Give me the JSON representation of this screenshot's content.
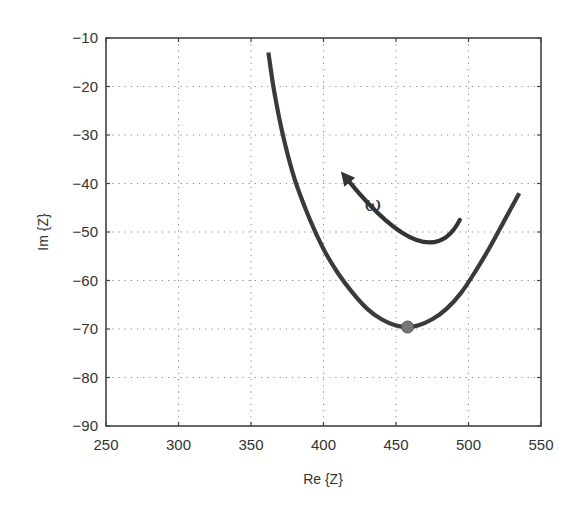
{
  "chart_data": {
    "type": "line",
    "title": "",
    "xlabel": "Re {Z}",
    "ylabel": "Im {Z}",
    "xlim": [
      250,
      550
    ],
    "ylim": [
      -90,
      -10
    ],
    "xticks": [
      250,
      300,
      350,
      400,
      450,
      500,
      550
    ],
    "yticks": [
      -10,
      -20,
      -30,
      -40,
      -50,
      -60,
      -70,
      -80,
      -90
    ],
    "xtick_labels": [
      "250",
      "300",
      "350",
      "400",
      "450",
      "500",
      "550"
    ],
    "ytick_labels": [
      "−10",
      "−20",
      "−30",
      "−40",
      "−50",
      "−60",
      "−70",
      "−80",
      "−90"
    ],
    "grid": true,
    "grid_style": "dotted",
    "legend": null,
    "series": [
      {
        "name": "impedance locus",
        "color": "#3a3a3a",
        "x": [
          362,
          366,
          372,
          380,
          390,
          400,
          410,
          420,
          430,
          440,
          450,
          458,
          465,
          475,
          485,
          495,
          505,
          515,
          525,
          535
        ],
        "y": [
          -13,
          -21,
          -30,
          -39,
          -47,
          -53.5,
          -58.5,
          -62.5,
          -65.8,
          -68,
          -69.3,
          -69.6,
          -69.3,
          -68,
          -65.8,
          -62.5,
          -58,
          -53,
          -47.5,
          -42
        ]
      }
    ],
    "markers": [
      {
        "name": "minimum-point",
        "x": 458,
        "y": -69.6,
        "color": "#777777"
      }
    ],
    "annotations": [
      {
        "type": "curved-arrow",
        "label": "ω",
        "from": {
          "x": 494,
          "y": -47.5
        },
        "via": {
          "x": 463,
          "y": -51.2
        },
        "to": {
          "x": 412,
          "y": -37.5
        },
        "label_pos": {
          "x": 434,
          "y": -43
        },
        "meaning": "direction of increasing frequency"
      }
    ]
  },
  "axes": {
    "x_label": "Re {Z}",
    "y_label": "Im {Z}"
  },
  "annotation": {
    "omega_label": "ω"
  },
  "colors": {
    "curve": "#3a3a3a",
    "marker": "#777777",
    "axis": "#444444",
    "grid": "#888888"
  }
}
